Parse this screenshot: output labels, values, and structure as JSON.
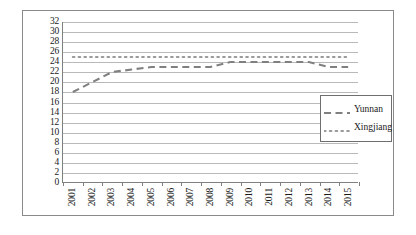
{
  "chart_data": {
    "type": "line",
    "title": "",
    "xlabel": "",
    "ylabel": "",
    "ylim": [
      0,
      32
    ],
    "ytick_step": 2,
    "yticks": [
      32,
      30,
      28,
      26,
      24,
      22,
      20,
      18,
      16,
      14,
      12,
      10,
      8,
      6,
      4,
      2,
      0
    ],
    "grid": true,
    "legend_position": "right",
    "categories": [
      "2001",
      "2002",
      "2003",
      "2004",
      "2005",
      "2006",
      "2007",
      "2008",
      "2009",
      "2010",
      "2011",
      "2012",
      "2013",
      "2014",
      "2015"
    ],
    "series": [
      {
        "name": "Yunnan",
        "style": "dashed",
        "color": "#808080",
        "values": [
          18,
          20,
          22,
          22.5,
          23,
          23,
          23,
          23,
          24,
          24,
          24,
          24,
          24,
          23,
          23
        ]
      },
      {
        "name": "Xingjiang",
        "style": "dotted",
        "color": "#a0a0a0",
        "values": [
          25,
          25,
          25,
          25,
          25,
          25,
          25,
          25,
          25,
          25,
          25,
          25,
          25,
          25,
          25
        ]
      }
    ]
  },
  "legend": {
    "items": [
      {
        "label": "Yunnan"
      },
      {
        "label": "Xingjiang"
      }
    ]
  }
}
